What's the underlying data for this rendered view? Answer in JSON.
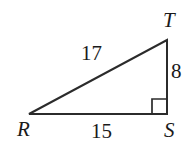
{
  "figure": {
    "kind": "right-triangle",
    "background_color": "#ffffff",
    "stroke_color": "#2b2b2b",
    "text_color": "#1a1a1a",
    "vertices": [
      {
        "name": "R",
        "label": "R",
        "x": 29,
        "y": 114
      },
      {
        "name": "S",
        "label": "S",
        "x": 167,
        "y": 114
      },
      {
        "name": "T",
        "label": "T",
        "x": 167,
        "y": 40
      }
    ],
    "sides": [
      {
        "name": "hypotenuse-RT",
        "label": "17",
        "from": "R",
        "to": "T"
      },
      {
        "name": "leg-TS",
        "label": "8",
        "from": "T",
        "to": "S"
      },
      {
        "name": "leg-RS",
        "label": "15",
        "from": "R",
        "to": "S"
      }
    ],
    "right_angle": {
      "at_vertex": "S",
      "marker": "square",
      "size": 15
    }
  }
}
